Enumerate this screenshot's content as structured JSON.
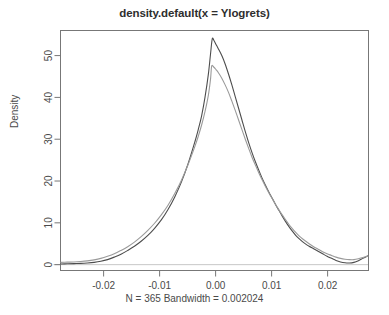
{
  "chart_data": {
    "type": "line",
    "title": "density.default(x = Ylogrets)",
    "subtitle": "N = 365   Bandwidth = 0.002024",
    "xlabel": "",
    "ylabel": "Density",
    "xlim": [
      -0.0277,
      0.0273
    ],
    "ylim": [
      -1.4,
      56.0
    ],
    "grid": false,
    "legend": false,
    "xticks": [
      -0.02,
      -0.01,
      0.0,
      0.01,
      0.02
    ],
    "xticklabels": [
      "-0.02",
      "-0.01",
      "0.00",
      "0.01",
      "0.02"
    ],
    "yticks": [
      0,
      10,
      20,
      30,
      40,
      50
    ],
    "yticklabels": [
      "0",
      "10",
      "20",
      "30",
      "40",
      "50"
    ],
    "colors": {
      "curve_dark": "#4d4d4d",
      "curve_light": "#9a9a9a",
      "axis": "#777777",
      "baseline": "#c8c8c8",
      "background": "#ffffff"
    },
    "series": [
      {
        "name": "density-curve-dark",
        "color": "#4d4d4d",
        "peak_x": -0.0006,
        "peak_y": 54.0,
        "points": [
          [
            -0.0277,
            0.15
          ],
          [
            -0.0265,
            0.2
          ],
          [
            -0.0253,
            0.25
          ],
          [
            -0.0241,
            0.3
          ],
          [
            -0.0229,
            0.4
          ],
          [
            -0.0217,
            0.55
          ],
          [
            -0.0205,
            0.8
          ],
          [
            -0.0193,
            1.2
          ],
          [
            -0.0181,
            1.8
          ],
          [
            -0.0169,
            2.5
          ],
          [
            -0.0157,
            3.4
          ],
          [
            -0.0145,
            4.4
          ],
          [
            -0.0133,
            5.6
          ],
          [
            -0.0121,
            7.0
          ],
          [
            -0.0109,
            8.7
          ],
          [
            -0.0097,
            10.7
          ],
          [
            -0.0085,
            13.2
          ],
          [
            -0.0073,
            16.2
          ],
          [
            -0.0061,
            19.8
          ],
          [
            -0.0049,
            24.2
          ],
          [
            -0.0037,
            29.4
          ],
          [
            -0.0031,
            32.3
          ],
          [
            -0.0025,
            35.6
          ],
          [
            -0.0019,
            40.0
          ],
          [
            -0.0013,
            45.5
          ],
          [
            -0.0009,
            50.5
          ],
          [
            -0.0006,
            54.0
          ],
          [
            -0.0003,
            53.6
          ],
          [
            0.0001,
            52.6
          ],
          [
            0.0005,
            51.6
          ],
          [
            0.0011,
            50.0
          ],
          [
            0.0017,
            48.0
          ],
          [
            0.0023,
            45.6
          ],
          [
            0.0029,
            43.0
          ],
          [
            0.0035,
            40.2
          ],
          [
            0.0041,
            37.4
          ],
          [
            0.0047,
            34.6
          ],
          [
            0.0053,
            31.8
          ],
          [
            0.0059,
            29.2
          ],
          [
            0.0065,
            26.8
          ],
          [
            0.0071,
            24.6
          ],
          [
            0.0077,
            22.6
          ],
          [
            0.0083,
            20.7
          ],
          [
            0.0089,
            19.0
          ],
          [
            0.0095,
            17.4
          ],
          [
            0.0101,
            15.9
          ],
          [
            0.0107,
            14.4
          ],
          [
            0.0113,
            13.0
          ],
          [
            0.0119,
            11.6
          ],
          [
            0.0125,
            10.3
          ],
          [
            0.0131,
            9.1
          ],
          [
            0.0137,
            8.0
          ],
          [
            0.0143,
            7.0
          ],
          [
            0.0149,
            6.2
          ],
          [
            0.0155,
            5.5
          ],
          [
            0.0161,
            4.9
          ],
          [
            0.0167,
            4.4
          ],
          [
            0.0175,
            3.8
          ],
          [
            0.0183,
            3.2
          ],
          [
            0.0191,
            2.6
          ],
          [
            0.0199,
            2.0
          ],
          [
            0.0207,
            1.5
          ],
          [
            0.0215,
            1.0
          ],
          [
            0.0223,
            0.65
          ],
          [
            0.0231,
            0.45
          ],
          [
            0.0239,
            0.4
          ],
          [
            0.0247,
            0.55
          ],
          [
            0.0255,
            0.95
          ],
          [
            0.0263,
            1.5
          ],
          [
            0.0273,
            2.2
          ]
        ]
      },
      {
        "name": "density-curve-light",
        "color": "#9a9a9a",
        "peak_x": -0.0007,
        "peak_y": 47.5,
        "points": [
          [
            -0.0277,
            0.55
          ],
          [
            -0.0265,
            0.6
          ],
          [
            -0.0253,
            0.65
          ],
          [
            -0.0241,
            0.75
          ],
          [
            -0.0229,
            0.9
          ],
          [
            -0.0217,
            1.15
          ],
          [
            -0.0205,
            1.5
          ],
          [
            -0.0193,
            2.0
          ],
          [
            -0.0181,
            2.6
          ],
          [
            -0.0169,
            3.4
          ],
          [
            -0.0157,
            4.3
          ],
          [
            -0.0145,
            5.4
          ],
          [
            -0.0133,
            6.7
          ],
          [
            -0.0121,
            8.2
          ],
          [
            -0.0109,
            9.9
          ],
          [
            -0.0097,
            11.9
          ],
          [
            -0.0085,
            14.2
          ],
          [
            -0.0073,
            17.0
          ],
          [
            -0.0061,
            20.2
          ],
          [
            -0.0049,
            24.0
          ],
          [
            -0.0037,
            28.3
          ],
          [
            -0.0031,
            30.7
          ],
          [
            -0.0025,
            33.4
          ],
          [
            -0.0019,
            36.6
          ],
          [
            -0.0013,
            40.5
          ],
          [
            -0.0009,
            44.5
          ],
          [
            -0.0007,
            47.5
          ],
          [
            -0.0003,
            47.2
          ],
          [
            0.0001,
            46.6
          ],
          [
            0.0005,
            45.9
          ],
          [
            0.0011,
            44.6
          ],
          [
            0.0017,
            43.0
          ],
          [
            0.0023,
            41.2
          ],
          [
            0.0029,
            39.1
          ],
          [
            0.0035,
            36.9
          ],
          [
            0.0041,
            34.6
          ],
          [
            0.0047,
            32.3
          ],
          [
            0.0053,
            30.0
          ],
          [
            0.0059,
            27.8
          ],
          [
            0.0065,
            25.7
          ],
          [
            0.0071,
            23.8
          ],
          [
            0.0077,
            22.0
          ],
          [
            0.0083,
            20.3
          ],
          [
            0.0089,
            18.7
          ],
          [
            0.0095,
            17.2
          ],
          [
            0.0101,
            15.8
          ],
          [
            0.0107,
            14.4
          ],
          [
            0.0113,
            13.1
          ],
          [
            0.0119,
            11.9
          ],
          [
            0.0125,
            10.7
          ],
          [
            0.0131,
            9.6
          ],
          [
            0.0137,
            8.6
          ],
          [
            0.0143,
            7.7
          ],
          [
            0.0149,
            6.9
          ],
          [
            0.0155,
            6.2
          ],
          [
            0.0161,
            5.6
          ],
          [
            0.0167,
            5.0
          ],
          [
            0.0175,
            4.3
          ],
          [
            0.0183,
            3.7
          ],
          [
            0.0191,
            3.1
          ],
          [
            0.0199,
            2.6
          ],
          [
            0.0207,
            2.2
          ],
          [
            0.0215,
            1.8
          ],
          [
            0.0223,
            1.5
          ],
          [
            0.0231,
            1.3
          ],
          [
            0.0239,
            1.2
          ],
          [
            0.0247,
            1.2
          ],
          [
            0.0255,
            1.4
          ],
          [
            0.0263,
            1.7
          ],
          [
            0.0273,
            2.1
          ]
        ]
      }
    ]
  }
}
